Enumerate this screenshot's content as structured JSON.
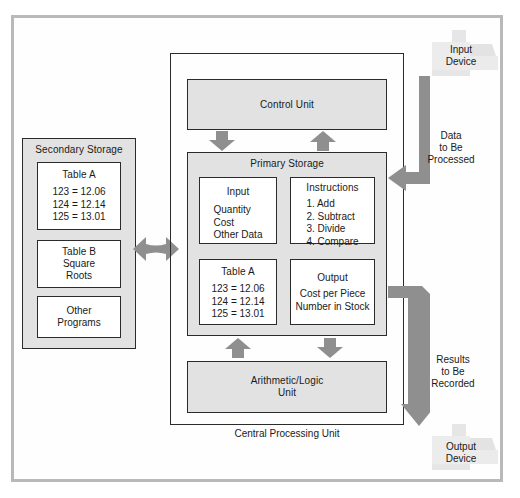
{
  "diagram": {
    "colors": {
      "box_fill": "#e2e2e2",
      "inner_fill": "#ffffff",
      "border": "#2b2b2b",
      "arrow": "#8f8f8f",
      "device": "#e8e8e8",
      "frame": "#b9b9b9"
    }
  },
  "cpu": {
    "label": "Central Processing Unit",
    "control_unit": {
      "label": "Control Unit"
    },
    "arithmetic_logic_unit": {
      "label": "Arithmetic/Logic\nUnit",
      "line1": "Arithmetic/Logic",
      "line2": "Unit"
    },
    "primary_storage": {
      "label": "Primary Storage",
      "cells": [
        {
          "name": "input",
          "title": "Input",
          "lines": [
            "Quantity",
            "Cost",
            "Other Data"
          ]
        },
        {
          "name": "instructions",
          "title": "Instructions",
          "lines": [
            "1. Add",
            "2. Subtract",
            "3. Divide",
            "4. Compare"
          ]
        },
        {
          "name": "table-a",
          "title": "Table A",
          "lines": [
            "123 = 12.06",
            "124 = 12.14",
            "125 = 13.01"
          ]
        },
        {
          "name": "output",
          "title": "Output",
          "lines": [
            "Cost per Piece",
            "Number in Stock"
          ]
        }
      ]
    }
  },
  "secondary_storage": {
    "label": "Secondary Storage",
    "cells": [
      {
        "name": "table-a",
        "title": "Table A",
        "lines": [
          "123 = 12.06",
          "124 = 12.14",
          "125 = 13.01"
        ]
      },
      {
        "name": "table-b",
        "title": "Table B",
        "lines": [
          "Square",
          "Roots"
        ]
      },
      {
        "name": "other-programs",
        "title": "",
        "lines": [
          "Other",
          "Programs"
        ]
      }
    ]
  },
  "io": {
    "input_device": {
      "line1": "Input",
      "line2": "Device"
    },
    "output_device": {
      "line1": "Output",
      "line2": "Device"
    },
    "data_flow": {
      "line1": "Data",
      "line2": "to Be",
      "line3": "Processed"
    },
    "results_flow": {
      "line1": "Results",
      "line2": "to Be",
      "line3": "Recorded"
    }
  }
}
